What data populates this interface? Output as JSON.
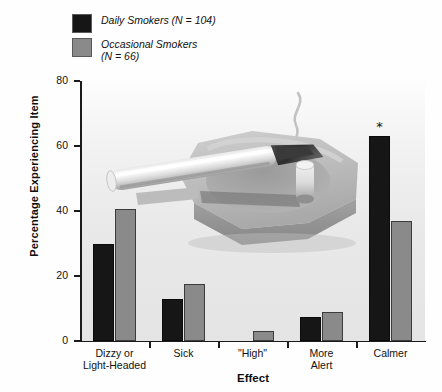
{
  "legend": {
    "items": [
      {
        "label": "Daily Smokers (N = 104)",
        "color": "#161616",
        "name": "daily-smokers"
      },
      {
        "label": "Occasional Smokers\n(N = 66)",
        "color": "#8a8a8a",
        "name": "occasional-smokers"
      }
    ]
  },
  "axes": {
    "ylabel": "Percentage Experiencing Item",
    "xlabel": "Effect",
    "yticks": [
      "0",
      "20",
      "40",
      "60",
      "80"
    ]
  },
  "annotations": {
    "significance_marker": "*"
  },
  "chart_data": {
    "type": "bar",
    "title": "",
    "xlabel": "Effect",
    "ylabel": "Percentage Experiencing Item",
    "ylim": [
      0,
      80
    ],
    "yticks": [
      0,
      20,
      40,
      60,
      80
    ],
    "grid": false,
    "legend_position": "top-left",
    "categories": [
      "Dizzy or\nLight-Headed",
      "Sick",
      "\"High\"",
      "More\nAlert",
      "Calmer"
    ],
    "series": [
      {
        "name": "Daily Smokers (N = 104)",
        "color": "#161616",
        "values": [
          30,
          13,
          0,
          7.5,
          63
        ]
      },
      {
        "name": "Occasional Smokers (N = 66)",
        "color": "#8a8a8a",
        "values": [
          40.5,
          17.5,
          3,
          9,
          37
        ]
      }
    ],
    "annotations": [
      {
        "text": "*",
        "category": "Calmer",
        "series": "Daily Smokers (N = 104)"
      }
    ]
  }
}
